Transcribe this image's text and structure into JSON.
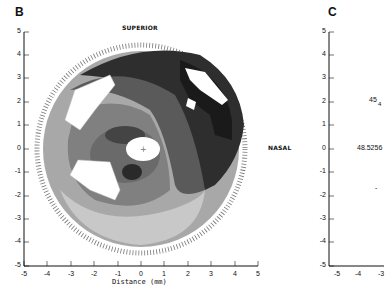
{
  "figure": {
    "panels": [
      {
        "id": "B",
        "label": "B",
        "annotations": {
          "top": "SUPERIOR",
          "right": "NASAL"
        },
        "y_ticks": [
          "5",
          "4",
          "3",
          "2",
          "1",
          "0",
          "-1",
          "-2",
          "-3",
          "-4",
          "-5"
        ],
        "x_ticks": [
          "-5",
          "-4",
          "-3",
          "-2",
          "-1",
          "0",
          "1",
          "2",
          "3",
          "4",
          "5"
        ],
        "xlabel": "Distance (mm)"
      },
      {
        "id": "C",
        "label": "C",
        "y_ticks": [
          "5",
          "4",
          "3",
          "2",
          "1",
          "0",
          "-1",
          "-2",
          "-3",
          "-4",
          "-5"
        ],
        "x_ticks": [
          "-5",
          "-4",
          "-3"
        ],
        "visible_values": [
          "45",
          "4",
          "48.5256",
          "-"
        ]
      }
    ]
  },
  "colors": {
    "darkest": "#2e2e2e",
    "dark": "#5a5a5a",
    "mid": "#808080",
    "light": "#a8a8a8",
    "lighter": "#c8c8c8",
    "white": "#ffffff"
  }
}
